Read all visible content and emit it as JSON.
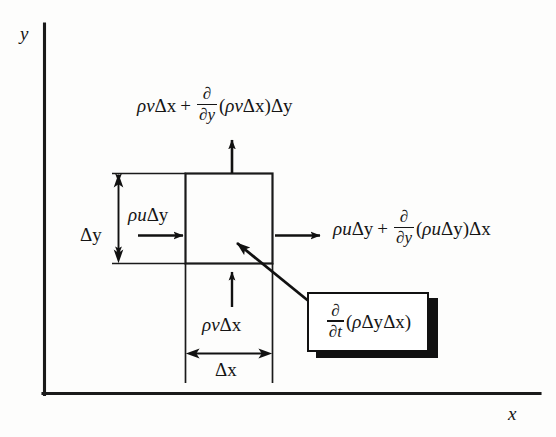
{
  "diagram": {
    "kind": "control-volume-mass-balance",
    "axes": {
      "y_label": "y",
      "x_label": "x"
    },
    "dimensions": {
      "height_label": "Δy",
      "width_label": "Δx"
    },
    "fluxes": {
      "left_in": {
        "rho": "ρ",
        "var": "u",
        "delta": "Δy",
        "plain": "ρuΔy"
      },
      "bottom_in": {
        "rho": "ρ",
        "var": "v",
        "delta": "Δx",
        "plain": "ρvΔx"
      },
      "top_out": {
        "base_rho": "ρ",
        "base_var": "v",
        "base_delta": "Δx",
        "plus": "+",
        "frac_num": "∂",
        "frac_den": "∂y",
        "open_paren": "(",
        "inner_rho": "ρ",
        "inner_var": "v",
        "inner_delta": "Δx",
        "close_paren": ")",
        "trail_delta": "Δy",
        "plain": "ρvΔx + ∂/∂y(ρvΔx)Δy"
      },
      "right_out": {
        "base_rho": "ρ",
        "base_var": "u",
        "base_delta": "Δy",
        "plus": "+",
        "frac_num": "∂",
        "frac_den": "∂y",
        "open_paren": "(",
        "inner_rho": "ρ",
        "inner_var": "u",
        "inner_delta": "Δy",
        "close_paren": ")",
        "trail_delta": "Δx",
        "plain": "ρuΔy + ∂/∂y(ρuΔy)Δx"
      }
    },
    "callout": {
      "frac_num": "∂",
      "frac_den": "∂t",
      "open_paren": "(",
      "rho": "ρ",
      "delta_y": "Δy",
      "delta_x": "Δx",
      "close_paren": ")",
      "plain": "∂/∂t(ρΔyΔx)"
    },
    "colors": {
      "ink": "#151515",
      "stroke": "#111111",
      "paper": "#fdfdfc",
      "shadow": "#111111"
    }
  }
}
